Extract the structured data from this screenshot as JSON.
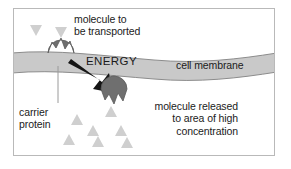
{
  "figure": {
    "labels": {
      "molecule_to_be_transported": "molecule to\nbe transported",
      "energy": "ENERGY",
      "cell_membrane": "cell membrane",
      "carrier_protein": "carrier\nprotein",
      "molecule_released": "molecule released\nto area of high\nconcentration"
    },
    "colors": {
      "background": "#ffffff",
      "frame_border": "#b9b9b9",
      "membrane_fill": "#c9c9c9",
      "membrane_stroke": "#8c8c8c",
      "protein_fill": "#6f6f6f",
      "protein_stroke": "#5a5a5a",
      "molecule_fill": "#cfcfcf",
      "arrow_fill": "#151515",
      "text": "#1b1b1b",
      "leader_line": "#9a9a9a"
    },
    "shapes": {
      "membrane": {
        "type": "wavy-band",
        "description": "horizontal gray band crossing full width, thicker at left, dipping and narrowing toward right"
      },
      "carrier_protein_upper": {
        "type": "notched-circle",
        "notch": "top",
        "cx": 60,
        "cy": 52,
        "r": 13,
        "state": "binding molecule at outside of membrane"
      },
      "carrier_protein_lower": {
        "type": "notched-circle",
        "notch": "bottom",
        "cx": 113,
        "cy": 88,
        "r": 13,
        "state": "releasing molecule at inside of membrane"
      },
      "energy_arrow": {
        "type": "arrow",
        "from": [
          72,
          60
        ],
        "to": [
          108,
          84
        ],
        "direction": "down-right"
      },
      "leader_line_carrier": {
        "from": [
          57,
          66
        ],
        "to": [
          57,
          101
        ]
      }
    },
    "molecules_outside": [
      {
        "x": 29,
        "y": 26,
        "size": 10,
        "orientation": "down"
      },
      {
        "x": 54,
        "y": 28,
        "size": 10,
        "orientation": "down"
      }
    ],
    "molecules_inside": [
      {
        "x": 76,
        "y": 113,
        "size": 10,
        "orientation": "up"
      },
      {
        "x": 110,
        "y": 105,
        "size": 10,
        "orientation": "up"
      },
      {
        "x": 92,
        "y": 124,
        "size": 10,
        "orientation": "up"
      },
      {
        "x": 120,
        "y": 124,
        "size": 10,
        "orientation": "up"
      },
      {
        "x": 68,
        "y": 133,
        "size": 10,
        "orientation": "up"
      },
      {
        "x": 97,
        "y": 135,
        "size": 10,
        "orientation": "up"
      },
      {
        "x": 126,
        "y": 136,
        "size": 10,
        "orientation": "up"
      }
    ]
  }
}
